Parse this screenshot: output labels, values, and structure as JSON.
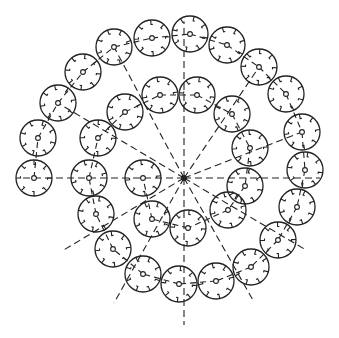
{
  "diagram": {
    "stroke_color": "#222222",
    "background": "#ffffff",
    "hub": {
      "x": 184,
      "y": 178,
      "r": 3
    },
    "circle_radius": 18,
    "rays": [
      {
        "x": 184,
        "y": 178,
        "x2": 22,
        "y2": 178
      },
      {
        "x": 184,
        "y": 178,
        "x2": 320,
        "y2": 178
      },
      {
        "x": 184,
        "y": 178,
        "x2": 184,
        "y2": 22
      },
      {
        "x": 184,
        "y": 178,
        "x2": 184,
        "y2": 325
      },
      {
        "x": 184,
        "y": 178,
        "x2": 114,
        "y2": 47
      },
      {
        "x": 184,
        "y": 178,
        "x2": 259,
        "y2": 67
      },
      {
        "x": 184,
        "y": 178,
        "x2": 58,
        "y2": 103
      },
      {
        "x": 184,
        "y": 178,
        "x2": 302,
        "y2": 132
      },
      {
        "x": 184,
        "y": 178,
        "x2": 62,
        "y2": 251
      },
      {
        "x": 184,
        "y": 178,
        "x2": 306,
        "y2": 250
      },
      {
        "x": 184,
        "y": 178,
        "x2": 114,
        "y2": 303
      },
      {
        "x": 184,
        "y": 178,
        "x2": 254,
        "y2": 302
      }
    ],
    "chain_links": [
      [
        34,
        178
      ],
      [
        38,
        138
      ],
      [
        58,
        103
      ],
      [
        83,
        72
      ],
      [
        114,
        47
      ],
      [
        152,
        38
      ],
      [
        190,
        34
      ],
      [
        227,
        45
      ],
      [
        259,
        67
      ],
      [
        286,
        94
      ],
      [
        302,
        132
      ],
      [
        305,
        170
      ],
      [
        297,
        207
      ],
      [
        278,
        240
      ],
      [
        251,
        267
      ],
      [
        216,
        281
      ],
      [
        179,
        284
      ],
      [
        143,
        274
      ],
      [
        113,
        249
      ],
      [
        96,
        214
      ],
      [
        89,
        178
      ],
      [
        98,
        138
      ],
      [
        125,
        112
      ],
      [
        160,
        95
      ],
      [
        197,
        95
      ],
      [
        232,
        114
      ],
      [
        250,
        148
      ],
      [
        245,
        186
      ],
      [
        228,
        210
      ],
      [
        188,
        228
      ],
      [
        152,
        219
      ],
      [
        143,
        178
      ]
    ],
    "circles": [
      {
        "x": 34,
        "y": 178
      },
      {
        "x": 38,
        "y": 138
      },
      {
        "x": 58,
        "y": 103
      },
      {
        "x": 83,
        "y": 72
      },
      {
        "x": 114,
        "y": 47
      },
      {
        "x": 152,
        "y": 38
      },
      {
        "x": 190,
        "y": 34
      },
      {
        "x": 227,
        "y": 45
      },
      {
        "x": 259,
        "y": 67
      },
      {
        "x": 286,
        "y": 94
      },
      {
        "x": 302,
        "y": 132
      },
      {
        "x": 305,
        "y": 170
      },
      {
        "x": 297,
        "y": 207
      },
      {
        "x": 278,
        "y": 240
      },
      {
        "x": 251,
        "y": 267
      },
      {
        "x": 216,
        "y": 281
      },
      {
        "x": 179,
        "y": 284
      },
      {
        "x": 143,
        "y": 274
      },
      {
        "x": 113,
        "y": 249
      },
      {
        "x": 96,
        "y": 214
      },
      {
        "x": 89,
        "y": 178
      },
      {
        "x": 98,
        "y": 138
      },
      {
        "x": 125,
        "y": 112
      },
      {
        "x": 160,
        "y": 95
      },
      {
        "x": 197,
        "y": 95
      },
      {
        "x": 232,
        "y": 114
      },
      {
        "x": 250,
        "y": 148
      },
      {
        "x": 245,
        "y": 186
      },
      {
        "x": 228,
        "y": 210
      },
      {
        "x": 188,
        "y": 228
      },
      {
        "x": 152,
        "y": 219
      },
      {
        "x": 143,
        "y": 178
      }
    ]
  }
}
